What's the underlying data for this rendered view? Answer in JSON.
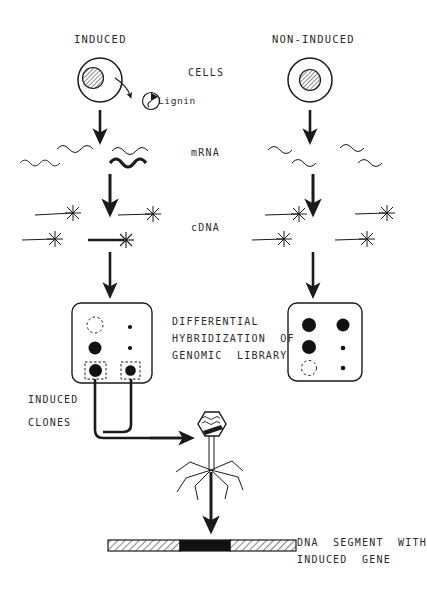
{
  "diagram": {
    "columns": {
      "induced": {
        "header": "INDUCED"
      },
      "non_induced": {
        "header": "NON-INDUCED"
      }
    },
    "row_labels": {
      "cells": "CELLS",
      "mrna": "mRNA",
      "cdna": "cDNA",
      "hybridization": [
        "DIFFERENTIAL",
        "HYBRIDIZATION  OF",
        "GENOMIC  LIBRARY"
      ]
    },
    "annotations": {
      "lignin": "Lignin",
      "induced_clones": [
        "INDUCED",
        "CLONES"
      ],
      "dna_segment": [
        "DNA  SEGMENT  WITH",
        "INDUCED  GENE"
      ]
    },
    "stages": [
      {
        "name": "cells",
        "label": "CELLS",
        "induced_detail": "cell with hatched nucleus secreting Lignin",
        "non_induced_detail": "cell with hatched nucleus"
      },
      {
        "name": "mrna",
        "label": "mRNA",
        "induced_count": 4,
        "induced_bold_count": 1,
        "non_induced_count": 4,
        "non_induced_bold_count": 0
      },
      {
        "name": "cdna",
        "label": "cDNA",
        "induced_count": 4,
        "induced_bold_count": 1,
        "non_induced_count": 4,
        "non_induced_bold_count": 0
      },
      {
        "name": "hybridization",
        "label": "DIFFERENTIAL HYBRIDIZATION OF GENOMIC LIBRARY"
      },
      {
        "name": "phage",
        "label": "recombinant phage"
      },
      {
        "name": "dna_segment",
        "label": "DNA SEGMENT WITH INDUCED GENE"
      }
    ],
    "plates": {
      "induced": {
        "spots": [
          {
            "col": 0,
            "row": 0,
            "kind": "empty",
            "boxed": false
          },
          {
            "col": 0,
            "row": 1,
            "kind": "dark",
            "boxed": false
          },
          {
            "col": 0,
            "row": 2,
            "kind": "dark",
            "boxed": true
          },
          {
            "col": 1,
            "row": 0,
            "kind": "faint",
            "boxed": false
          },
          {
            "col": 1,
            "row": 1,
            "kind": "faint",
            "boxed": false
          },
          {
            "col": 1,
            "row": 2,
            "kind": "dark",
            "boxed": true
          }
        ]
      },
      "non_induced": {
        "spots": [
          {
            "col": 0,
            "row": 0,
            "kind": "dark",
            "boxed": false
          },
          {
            "col": 0,
            "row": 1,
            "kind": "dark",
            "boxed": false
          },
          {
            "col": 0,
            "row": 2,
            "kind": "empty",
            "boxed": false
          },
          {
            "col": 1,
            "row": 0,
            "kind": "dark",
            "boxed": false
          },
          {
            "col": 1,
            "row": 1,
            "kind": "faint",
            "boxed": false
          },
          {
            "col": 1,
            "row": 2,
            "kind": "faint",
            "boxed": false
          }
        ]
      }
    },
    "colors": {
      "ink": "#1a1a1a",
      "text": "#2b2b2b",
      "spot_dark": "#111111",
      "paper": "#ffffff"
    }
  }
}
